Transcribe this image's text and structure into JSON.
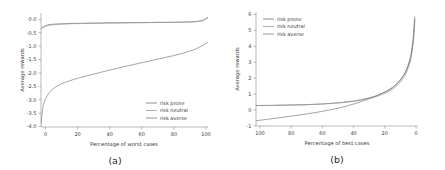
{
  "figure": {
    "panels": [
      {
        "caption": "(a)",
        "xlabel": "Percentage of worst cases",
        "ylabel": "Average rewards",
        "xticks": [
          "0",
          "20",
          "40",
          "60",
          "80",
          "100"
        ],
        "yticks": [
          "0.0",
          "-0.5",
          "-1.0",
          "-1.5",
          "-2.0",
          "-2.5",
          "-3.0",
          "-3.5",
          "-4.0"
        ],
        "legend": [
          {
            "label": "risk prone",
            "color": "#6e6e6e"
          },
          {
            "label": "risk neutral",
            "color": "#9a9a9a"
          },
          {
            "label": "risk averse",
            "color": "#7d7d7d"
          }
        ]
      },
      {
        "caption": "(b)",
        "xlabel": "Percentage of best cases",
        "ylabel": "Average rewards",
        "xticks": [
          "100",
          "80",
          "60",
          "40",
          "20",
          "0"
        ],
        "yticks": [
          "6",
          "5",
          "4",
          "3",
          "2",
          "1",
          "0",
          "-1"
        ],
        "legend": [
          {
            "label": "risk prone",
            "color": "#6e6e6e"
          },
          {
            "label": "risk neutral",
            "color": "#9a9a9a"
          },
          {
            "label": "risk averse",
            "color": "#7d7d7d"
          }
        ]
      }
    ]
  },
  "chart_data": [
    {
      "type": "line",
      "title": "(a)",
      "xlabel": "Percentage of worst cases",
      "ylabel": "Average rewards",
      "xlim": [
        0,
        100
      ],
      "ylim": [
        -4.0,
        0.3
      ],
      "xticks": [
        0,
        20,
        40,
        60,
        80,
        100
      ],
      "yticks": [
        0.0,
        -0.5,
        -1.0,
        -1.5,
        -2.0,
        -2.5,
        -3.0,
        -3.5,
        -4.0
      ],
      "grid": false,
      "legend_position": "lower right",
      "x": [
        0,
        1,
        2,
        3,
        5,
        8,
        12,
        16,
        20,
        25,
        30,
        35,
        40,
        45,
        50,
        55,
        60,
        65,
        70,
        75,
        80,
        85,
        90,
        93,
        96,
        98,
        99,
        100
      ],
      "series": [
        {
          "name": "risk prone",
          "color": "#6e6e6e",
          "values": [
            -0.29,
            -0.24,
            -0.2,
            -0.17,
            -0.14,
            -0.12,
            -0.11,
            -0.1,
            -0.09,
            -0.09,
            -0.08,
            -0.08,
            -0.07,
            -0.07,
            -0.07,
            -0.06,
            -0.06,
            -0.06,
            -0.05,
            -0.05,
            -0.05,
            -0.04,
            -0.03,
            -0.02,
            0.01,
            0.06,
            0.1,
            0.14
          ]
        },
        {
          "name": "risk neutral",
          "color": "#9a9a9a",
          "values": [
            -0.31,
            -0.26,
            -0.22,
            -0.19,
            -0.16,
            -0.14,
            -0.12,
            -0.11,
            -0.1,
            -0.1,
            -0.09,
            -0.09,
            -0.08,
            -0.08,
            -0.07,
            -0.07,
            -0.07,
            -0.06,
            -0.06,
            -0.06,
            -0.05,
            -0.05,
            -0.04,
            -0.03,
            0.0,
            0.04,
            0.08,
            0.12
          ]
        },
        {
          "name": "risk averse",
          "color": "#7d7d7d",
          "values": [
            -3.9,
            -3.3,
            -3.05,
            -2.9,
            -2.7,
            -2.52,
            -2.38,
            -2.28,
            -2.2,
            -2.11,
            -2.03,
            -1.95,
            -1.87,
            -1.8,
            -1.72,
            -1.65,
            -1.58,
            -1.51,
            -1.44,
            -1.37,
            -1.3,
            -1.22,
            -1.12,
            -1.05,
            -0.95,
            -0.88,
            -0.84,
            -0.8
          ]
        }
      ]
    },
    {
      "type": "line",
      "title": "(b)",
      "xlabel": "Percentage of best cases",
      "ylabel": "Average rewards",
      "xlim": [
        100,
        0
      ],
      "ylim": [
        -1,
        6
      ],
      "xticks": [
        100,
        80,
        60,
        40,
        20,
        0
      ],
      "yticks": [
        6,
        5,
        4,
        3,
        2,
        1,
        0,
        -1
      ],
      "grid": false,
      "legend_position": "upper left",
      "x": [
        100,
        90,
        80,
        70,
        60,
        50,
        45,
        40,
        35,
        30,
        25,
        20,
        16,
        12,
        9,
        7,
        5,
        4,
        3,
        2.5,
        2
      ],
      "series": [
        {
          "name": "risk prone",
          "color": "#6e6e6e",
          "values": [
            0.26,
            0.27,
            0.29,
            0.31,
            0.35,
            0.42,
            0.47,
            0.53,
            0.62,
            0.73,
            0.88,
            1.1,
            1.33,
            1.68,
            2.1,
            2.5,
            3.1,
            3.6,
            4.35,
            4.95,
            5.7
          ]
        },
        {
          "name": "risk neutral",
          "color": "#9a9a9a",
          "values": [
            0.25,
            0.26,
            0.28,
            0.3,
            0.34,
            0.41,
            0.45,
            0.51,
            0.59,
            0.69,
            0.83,
            1.03,
            1.24,
            1.56,
            1.95,
            2.32,
            2.88,
            3.36,
            4.08,
            4.66,
            5.45
          ]
        },
        {
          "name": "risk averse",
          "color": "#7d7d7d",
          "values": [
            -0.68,
            -0.55,
            -0.42,
            -0.28,
            -0.12,
            0.08,
            0.2,
            0.34,
            0.5,
            0.68,
            0.88,
            1.12,
            1.36,
            1.7,
            2.08,
            2.44,
            2.98,
            3.46,
            4.18,
            4.78,
            5.55
          ]
        }
      ]
    }
  ]
}
